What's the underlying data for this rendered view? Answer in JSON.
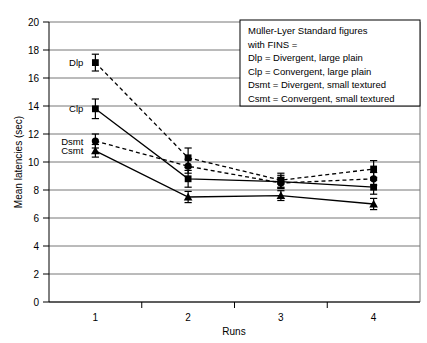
{
  "chart_data": {
    "type": "line",
    "title": "",
    "xlabel": "Runs",
    "ylabel": "Mean latencies (sec)",
    "categories": [
      "1",
      "2",
      "3",
      "4"
    ],
    "xlim": [
      0.5,
      4.5
    ],
    "ylim": [
      0,
      20
    ],
    "yticks": [
      0,
      2,
      4,
      6,
      8,
      10,
      12,
      14,
      16,
      18,
      20
    ],
    "ytick_labels": [
      "0",
      "2",
      "4",
      "6",
      "8",
      "10",
      "12",
      "14",
      "16",
      "18",
      "20"
    ],
    "grid": "horizontal",
    "legend_position": "inside-top-right",
    "series": [
      {
        "name": "Dlp",
        "label": "Dlp",
        "linestyle": "dashed",
        "marker": "square",
        "color": "#000000",
        "values": [
          17.1,
          10.3,
          8.7,
          9.5
        ],
        "errors": [
          0.6,
          0.7,
          0.5,
          0.6
        ]
      },
      {
        "name": "Clp",
        "label": "Clp",
        "linestyle": "solid",
        "marker": "square",
        "color": "#000000",
        "values": [
          13.8,
          8.8,
          8.6,
          8.2
        ],
        "errors": [
          0.7,
          0.6,
          0.45,
          0.5
        ]
      },
      {
        "name": "Dsmt",
        "label": "Dsmt",
        "linestyle": "dashed",
        "marker": "circle",
        "color": "#000000",
        "values": [
          11.5,
          9.7,
          8.5,
          8.8
        ],
        "errors": [
          0.5,
          0.5,
          0.4,
          0.45
        ]
      },
      {
        "name": "Csmt",
        "label": "Csmt",
        "linestyle": "solid",
        "marker": "triangle",
        "color": "#000000",
        "values": [
          10.8,
          7.5,
          7.6,
          7.0
        ],
        "errors": [
          0.45,
          0.4,
          0.35,
          0.4
        ]
      }
    ],
    "annotations": [
      {
        "name": "Dlp",
        "text": "Dlp",
        "value": 17.1
      },
      {
        "name": "Clp",
        "text": "Clp",
        "value": 13.8
      },
      {
        "name": "Dsmt",
        "text": "Dsmt",
        "value": 11.5
      },
      {
        "name": "Csmt",
        "text": "Csmt",
        "value": 10.8
      }
    ]
  },
  "legend": {
    "lines": [
      "Müller-Lyer Standard figures",
      " with FINS =",
      "Dlp = Divergent, large plain",
      "Clp = Convergent, large plain",
      "Dsmt = Divergent, small textured",
      "Csmt = Convergent, small textured"
    ]
  }
}
